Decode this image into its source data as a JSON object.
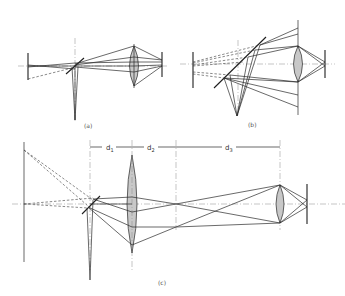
{
  "figure": {
    "panels": [
      {
        "id": "a",
        "label": "(a)"
      },
      {
        "id": "b",
        "label": "(b)"
      },
      {
        "id": "c",
        "label": "(c)"
      }
    ],
    "dimensions": {
      "d1": {
        "base": "d",
        "sub": "1"
      },
      "d2": {
        "base": "d",
        "sub": "2"
      },
      "d3": {
        "base": "d",
        "sub": "3"
      }
    },
    "colors": {
      "line": "#2a2a2a",
      "lens_fill": "#c8c8c8",
      "axis": "#8a8a8a",
      "background": "#ffffff"
    }
  }
}
